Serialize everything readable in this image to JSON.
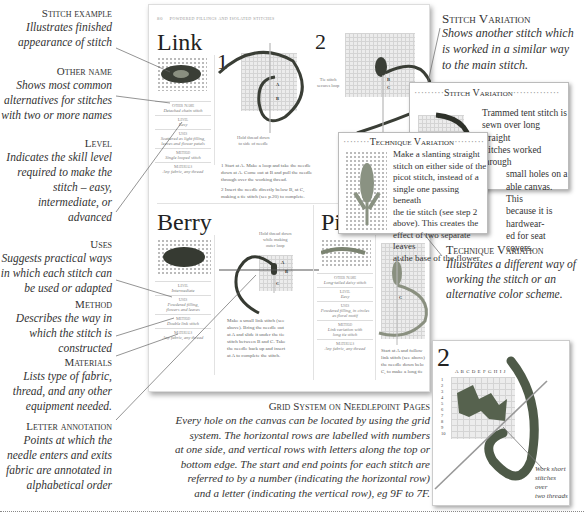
{
  "callouts_left": [
    {
      "title": "Stitch example",
      "desc": [
        "Illustrates finished",
        "appearance of stitch"
      ]
    },
    {
      "title": "Other name",
      "desc": [
        "Shows most common",
        "alternatives for stitches",
        "with two or more names"
      ]
    },
    {
      "title": "Level",
      "desc": [
        "Indicates the skill level",
        "required to make the",
        "stitch – easy,",
        "intermediate, or",
        "advanced"
      ]
    },
    {
      "title": "Uses",
      "desc": [
        "Suggests practical ways",
        "in which each stitch can",
        "be used or adapted"
      ]
    },
    {
      "title": "Method",
      "desc": [
        "Describes the way in",
        "which the stitch is",
        "constructed"
      ]
    },
    {
      "title": "Materials",
      "desc": [
        "Lists type of fabric,",
        "thread, and any other",
        "equipment needed."
      ]
    },
    {
      "title": "Letter annotation",
      "desc": [
        "Points at which the",
        "needle enters and exits",
        "fabric are annotated in",
        "alphabetical order"
      ]
    }
  ],
  "callouts_right": {
    "stitch_variation": {
      "title": "Stitch Variation",
      "desc": [
        "Shows another stitch which",
        "is worked in a similar way",
        "to the main stitch."
      ]
    },
    "technique_variation": {
      "title": "Technique Variation",
      "desc": [
        "Illustrates a different way of",
        "working the stitch or an",
        "alternative color scheme."
      ]
    }
  },
  "page": {
    "number": "80",
    "running_head": "Powdered Fillings and Isolated Stitches",
    "link": {
      "title": "Link",
      "other_name_label": "Other Name",
      "other_name": "Detached chain stitch",
      "level_label": "Level",
      "level": "Easy",
      "uses_label": "Uses",
      "uses": [
        "Scattered as light filling,",
        "leaves and flower petals"
      ],
      "method_label": "Method",
      "method": "Single looped stitch",
      "materials_label": "Materials",
      "materials": "Any fabric, any thread",
      "step1_num": "1",
      "step2_num": "2",
      "hold_note": [
        "Hold thread down",
        "to side of needle"
      ],
      "tie_note": [
        "Tie stitch",
        "secures loop"
      ],
      "pt_a": "A",
      "pt_b": "B",
      "pt_b2": "B",
      "pt_c": "C",
      "step1_text": [
        "1 Start at A. Make a loop and take the needle",
        "down at A. Come out at B and pull the needle",
        "through over the working thread."
      ],
      "step2_text": [
        "2 Insert the needle directly below B, at C,",
        "making a tie stitch (see p.20) to complete."
      ]
    },
    "berry": {
      "title": "Berry",
      "level_label": "Level",
      "level": "Intermediate",
      "uses_label": "Uses",
      "uses": [
        "Powdered filling,",
        "flowers and leaves"
      ],
      "method_label": "Method",
      "method": "Double link stitch",
      "materials_label": "Materials",
      "materials": "Any fabric, any thread",
      "hold_note": [
        "Hold thread down",
        "while making",
        "outer loop"
      ],
      "pt_a": "A",
      "pt_b": "B",
      "pt_c": "C",
      "text": [
        "Make a small link stitch (see",
        "above). Bring the needle out",
        "at A and slide it under the tie",
        "stitch between B and C. Take",
        "the needle back up and insert",
        "at A to complete the stitch."
      ]
    },
    "picot": {
      "title": "Picot",
      "other_name_label": "Other Name",
      "other_name": "Long-tailed daisy stitch",
      "level_label": "Level",
      "level": "Easy",
      "uses_label": "Uses",
      "uses": [
        "Powdered filling, in circles",
        "as floral motif"
      ],
      "method_label": "Method",
      "method": [
        "Link variation with",
        "long tie stitch"
      ],
      "materials_label": "Materials",
      "materials": "Any fabric, any thread",
      "pt_a": "A",
      "pt_c": "C",
      "text": [
        "Start at A and follow",
        "link stitch (see above)",
        "the needle down belo",
        "C, to make a long tie"
      ]
    }
  },
  "stitch_variation_box": {
    "heading": "Stitch Variation",
    "text": [
      "Trammed tent stitch is",
      "sewn over long straight",
      "stitches worked through",
      "small holes on a",
      "able canvas. This",
      "because it is hardwear-",
      "ed for seat covers."
    ]
  },
  "technique_variation_box": {
    "heading": "Technique Variation",
    "text": [
      "Make a slanting straight",
      "stitch on either side of the",
      "picot stitch, instead of a",
      "single one passing beneath",
      "the tie stitch (see step 2",
      "above). This creates the",
      "effect of two separate leaves",
      "at the base of the flower."
    ]
  },
  "grid_system": {
    "title": "Grid System on Needlepoint Pages",
    "desc": [
      "Every hole on the canvas can be located by using the grid",
      "system. The horizontal rows are labelled with numbers",
      "at one side, and vertical rows with letters along the top or",
      "bottom edge. The start and end points for each stitch are",
      "referred to by a number (indicating the horizontal row)",
      "and a letter (indicating the vertical row), eg 9F to 7F."
    ]
  },
  "needlepoint_panel": {
    "step_num": "2",
    "column_letters": "A B C D E F G H I J",
    "row_numbers": [
      "1",
      "2",
      "3",
      "4",
      "5",
      "6",
      "7",
      "8",
      "9",
      "10"
    ],
    "note": [
      "Work short",
      "stitches over",
      "two threads"
    ]
  },
  "colors": {
    "thread_dark": "#3a3e36",
    "thread_green": "#5c6650",
    "needle": "#b8b8b8",
    "grid": "#d4d4d4"
  }
}
